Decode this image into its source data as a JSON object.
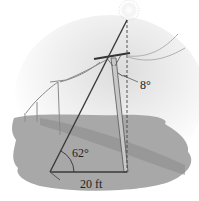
{
  "figure": {
    "labels": {
      "angle_bottom": "62°",
      "angle_top": "8°",
      "base_length": "20 ft"
    },
    "colors": {
      "ground": "#9a9a9a",
      "line": "#3a3a3a",
      "sky_glow": "#e8e8e8"
    }
  }
}
